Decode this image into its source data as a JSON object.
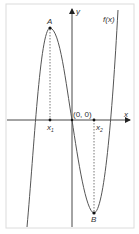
{
  "figure": {
    "function_label": "f(x)",
    "x_axis_label": "x",
    "y_axis_label": "y",
    "origin_label": "(0, 0)",
    "points": [
      {
        "name": "A",
        "role": "local maximum"
      },
      {
        "name": "B",
        "role": "local minimum"
      }
    ],
    "x_markers": [
      {
        "label": "x",
        "subscript": "1"
      },
      {
        "label": "x",
        "subscript": "2"
      }
    ],
    "colors": {
      "curve": "#555555",
      "axes": "#333333",
      "frame": "#dddddd",
      "dashed": "#555555"
    }
  }
}
